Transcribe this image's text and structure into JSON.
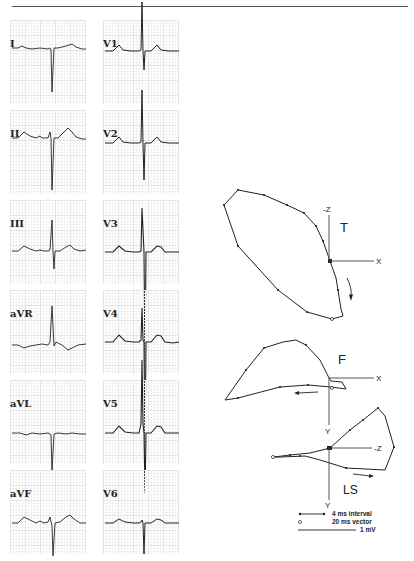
{
  "figure": {
    "ecg_leads": {
      "left_column": [
        "I",
        "II",
        "III",
        "aVR",
        "aVL",
        "aVF"
      ],
      "right_column": [
        "V1",
        "V2",
        "V3",
        "V4",
        "V5",
        "V6"
      ]
    },
    "vcg_planes": [
      {
        "label": "T",
        "axes": {
          "horizontal": "X",
          "vertical": "-Z"
        }
      },
      {
        "label": "F",
        "axes": {
          "horizontal": "X",
          "vertical": "Y"
        }
      },
      {
        "label": "LS",
        "axes": {
          "horizontal": "-Z",
          "vertical_top": "Y",
          "vertical_bottom": "Y"
        }
      }
    ],
    "legend": {
      "interval": "4 ms interval",
      "vector": "20 ms vector",
      "scale": "1 mV"
    }
  }
}
